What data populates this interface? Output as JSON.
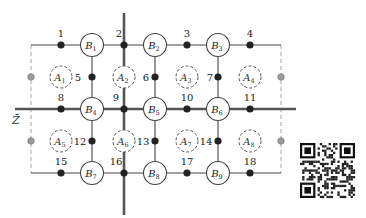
{
  "diagram": {
    "title": "",
    "axis_label": "Z̄",
    "thick_line_color": "#555555",
    "line_color": "#444444",
    "node_color": "#222222",
    "ghost_node_color": "#9a9a9a",
    "b_nodes": [
      {
        "id": "B1",
        "main": "B",
        "sub": "1",
        "x": 92,
        "y": 45
      },
      {
        "id": "B2",
        "main": "B",
        "sub": "2",
        "x": 155,
        "y": 45
      },
      {
        "id": "B3",
        "main": "B",
        "sub": "3",
        "x": 218,
        "y": 45
      },
      {
        "id": "B4",
        "main": "B",
        "sub": "4",
        "x": 92,
        "y": 109
      },
      {
        "id": "B5",
        "main": "B",
        "sub": "5",
        "x": 155,
        "y": 109
      },
      {
        "id": "B6",
        "main": "B",
        "sub": "6",
        "x": 218,
        "y": 109
      },
      {
        "id": "B7",
        "main": "B",
        "sub": "7",
        "x": 92,
        "y": 173
      },
      {
        "id": "B8",
        "main": "B",
        "sub": "8",
        "x": 155,
        "y": 173
      },
      {
        "id": "B9",
        "main": "B",
        "sub": "9",
        "x": 218,
        "y": 173
      }
    ],
    "a_nodes": [
      {
        "id": "A1",
        "main": "A",
        "sub": "1",
        "x": 61,
        "y": 77
      },
      {
        "id": "A2",
        "main": "A",
        "sub": "2",
        "x": 124,
        "y": 77
      },
      {
        "id": "A3",
        "main": "A",
        "sub": "3",
        "x": 187,
        "y": 77
      },
      {
        "id": "A4",
        "main": "A",
        "sub": "4",
        "x": 250,
        "y": 77
      },
      {
        "id": "A5",
        "main": "A",
        "sub": "5",
        "x": 61,
        "y": 141
      },
      {
        "id": "A6",
        "main": "A",
        "sub": "6",
        "x": 124,
        "y": 141
      },
      {
        "id": "A7",
        "main": "A",
        "sub": "7",
        "x": 187,
        "y": 141
      },
      {
        "id": "A8",
        "main": "A",
        "sub": "8",
        "x": 250,
        "y": 141
      }
    ],
    "numbered_nodes": [
      {
        "n": "1",
        "x": 61,
        "y": 45,
        "lx": 61,
        "ly": 37,
        "anchor": "middle"
      },
      {
        "n": "2",
        "x": 124,
        "y": 45,
        "lx": 119,
        "ly": 37,
        "anchor": "middle"
      },
      {
        "n": "3",
        "x": 187,
        "y": 45,
        "lx": 187,
        "ly": 37,
        "anchor": "middle"
      },
      {
        "n": "4",
        "x": 250,
        "y": 45,
        "lx": 250,
        "ly": 37,
        "anchor": "middle"
      },
      {
        "n": "5",
        "x": 92,
        "y": 77,
        "lx": 78,
        "ly": 81,
        "anchor": "middle"
      },
      {
        "n": "6",
        "x": 155,
        "y": 77,
        "lx": 146,
        "ly": 81,
        "anchor": "middle"
      },
      {
        "n": "7",
        "x": 218,
        "y": 77,
        "lx": 210,
        "ly": 81,
        "anchor": "middle"
      },
      {
        "n": "8",
        "x": 61,
        "y": 109,
        "lx": 61,
        "ly": 101,
        "anchor": "middle"
      },
      {
        "n": "9",
        "x": 124,
        "y": 109,
        "lx": 116,
        "ly": 101,
        "anchor": "middle"
      },
      {
        "n": "10",
        "x": 187,
        "y": 109,
        "lx": 187,
        "ly": 101,
        "anchor": "middle"
      },
      {
        "n": "11",
        "x": 250,
        "y": 109,
        "lx": 250,
        "ly": 101,
        "anchor": "middle"
      },
      {
        "n": "12",
        "x": 92,
        "y": 141,
        "lx": 80,
        "ly": 145,
        "anchor": "middle"
      },
      {
        "n": "13",
        "x": 155,
        "y": 141,
        "lx": 143,
        "ly": 145,
        "anchor": "middle"
      },
      {
        "n": "14",
        "x": 218,
        "y": 141,
        "lx": 206,
        "ly": 145,
        "anchor": "middle"
      },
      {
        "n": "15",
        "x": 61,
        "y": 173,
        "lx": 61,
        "ly": 165,
        "anchor": "middle"
      },
      {
        "n": "16",
        "x": 124,
        "y": 173,
        "lx": 116,
        "ly": 165,
        "anchor": "middle"
      },
      {
        "n": "17",
        "x": 187,
        "y": 173,
        "lx": 187,
        "ly": 165,
        "anchor": "middle"
      },
      {
        "n": "18",
        "x": 250,
        "y": 173,
        "lx": 250,
        "ly": 165,
        "anchor": "middle"
      }
    ],
    "ghost_nodes": [
      {
        "x": 31,
        "y": 77
      },
      {
        "x": 31,
        "y": 141
      },
      {
        "x": 281,
        "y": 77
      },
      {
        "x": 281,
        "y": 141
      }
    ],
    "qr_code": {
      "label": "qr-code",
      "x": 300,
      "y": 143,
      "size": 55
    }
  }
}
